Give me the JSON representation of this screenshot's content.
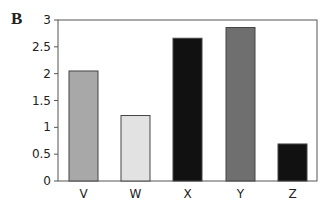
{
  "panel_label": "B",
  "chart_data": {
    "type": "bar",
    "title": "",
    "xlabel": "",
    "ylabel": "",
    "categories": [
      "V",
      "W",
      "X",
      "Y",
      "Z"
    ],
    "values": [
      2.05,
      1.22,
      2.66,
      2.86,
      0.69
    ],
    "colors": [
      "#a8a8a8",
      "#e2e2e2",
      "#111111",
      "#6f6f6f",
      "#111111"
    ],
    "ylim": [
      0,
      3
    ],
    "yticks": [
      "0",
      "0.5",
      "1",
      "1.5",
      "2",
      "2.5",
      "3"
    ],
    "grid": false,
    "legend": null
  }
}
